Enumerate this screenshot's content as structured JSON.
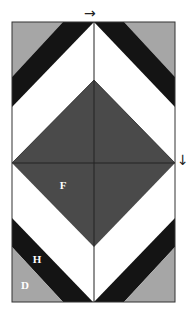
{
  "diagram": {
    "colors": {
      "grey": "#a6a6a6",
      "black": "#141414",
      "dark": "#4a4a4a",
      "white": "#ffffff",
      "outline": "#222222"
    },
    "labels": {
      "F": "F",
      "Gr": "Gr",
      "G": "G",
      "H": "H",
      "D": "D"
    },
    "arrows": {
      "top": "→",
      "right": "↓"
    }
  }
}
